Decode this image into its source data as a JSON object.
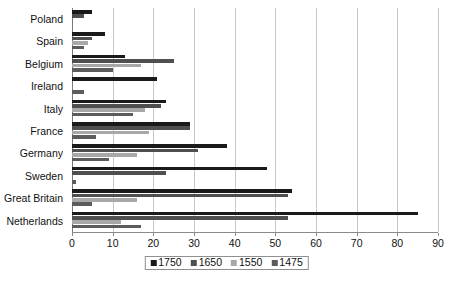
{
  "chart_data": {
    "type": "bar",
    "orientation": "horizontal",
    "title": "",
    "subtitle": "",
    "xlabel": "",
    "ylabel": "",
    "xlim": [
      0,
      90
    ],
    "xticks": [
      0,
      10,
      20,
      30,
      40,
      50,
      60,
      70,
      80,
      90
    ],
    "grid": true,
    "legend_position": "bottom",
    "categories": [
      "Poland",
      "Spain",
      "Belgium",
      "Ireland",
      "Italy",
      "France",
      "Germany",
      "Sweden",
      "Great Britain",
      "Netherlands"
    ],
    "series": [
      {
        "name": "1750",
        "color": "#1a1a1a",
        "values": [
          5,
          8,
          13,
          21,
          23,
          29,
          38,
          48,
          54,
          85
        ]
      },
      {
        "name": "1650",
        "color": "#4f4f4f",
        "values": [
          3,
          5,
          25,
          0,
          22,
          29,
          31,
          23,
          53,
          53
        ]
      },
      {
        "name": "1550",
        "color": "#a8a8a8",
        "values": [
          0,
          4,
          17,
          0,
          18,
          19,
          16,
          0,
          16,
          12
        ]
      },
      {
        "name": "1475",
        "color": "#5c5c5c",
        "values": [
          0,
          3,
          10,
          3,
          15,
          6,
          9,
          1,
          5,
          17
        ]
      }
    ]
  },
  "legend": {
    "items": [
      {
        "label": "1750",
        "color": "#1a1a1a"
      },
      {
        "label": "1650",
        "color": "#4f4f4f"
      },
      {
        "label": "1550",
        "color": "#a8a8a8"
      },
      {
        "label": "1475",
        "color": "#5c5c5c"
      }
    ]
  }
}
